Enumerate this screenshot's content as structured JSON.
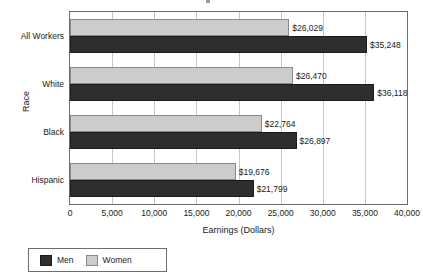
{
  "chart_data": {
    "type": "bar",
    "orientation": "horizontal",
    "title": "",
    "xlabel": "Earnings (Dollars)",
    "ylabel": "Race",
    "categories": [
      "All Workers",
      "White",
      "Black",
      "Hispanic"
    ],
    "series": [
      {
        "name": "Men",
        "color": "#2e2e2e",
        "values": [
          35248,
          36118,
          26897,
          21799
        ],
        "labels": [
          "$35,248",
          "$36,118",
          "$26,897",
          "$21,799"
        ]
      },
      {
        "name": "Women",
        "color": "#cccccc",
        "values": [
          26029,
          26470,
          22764,
          19676
        ],
        "labels": [
          "$26,029",
          "$26,470",
          "$22,764",
          "$19,676"
        ]
      }
    ],
    "xlim": [
      0,
      40000
    ],
    "xticks": [
      0,
      5000,
      10000,
      15000,
      20000,
      25000,
      30000,
      35000,
      40000
    ],
    "xtick_labels": [
      "0",
      "5,000",
      "10,000",
      "15,000",
      "20,000",
      "25,000",
      "30,000",
      "35,000",
      "40,000"
    ],
    "grid": true,
    "grid_axis": "x",
    "legend_position": "bottom-left",
    "legend_entries": [
      "Men",
      "Women"
    ]
  },
  "axes": {
    "x_title": "Earnings (Dollars)",
    "y_title": "Race"
  },
  "legend": {
    "entries": [
      {
        "label": "Men",
        "color": "#2e2e2e"
      },
      {
        "label": "Women",
        "color": "#cccccc"
      }
    ]
  }
}
